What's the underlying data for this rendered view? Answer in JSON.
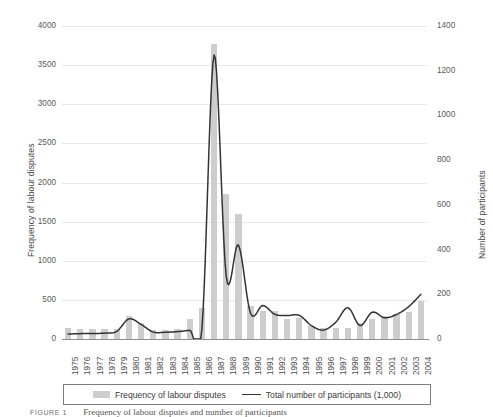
{
  "chart_data": {
    "type": "bar",
    "title": "",
    "subtitle": "",
    "xlabel": "",
    "ylabel": "Frequency of labour disputes",
    "ylabel_secondary": "Number of participants",
    "grid": true,
    "legend_position": "bottom",
    "ylim": [
      0,
      4000
    ],
    "ylim_secondary": [
      0,
      1400
    ],
    "yticks": [
      "0",
      "500",
      "1000",
      "1500",
      "2000",
      "2500",
      "3000",
      "3500",
      "4000"
    ],
    "ytick_values": [
      0,
      500,
      1000,
      1500,
      2000,
      2500,
      3000,
      3500,
      4000
    ],
    "yticks_secondary": [
      "0",
      "200",
      "400",
      "600",
      "800",
      "1000",
      "1200",
      "1400"
    ],
    "ytick_values_secondary": [
      0,
      200,
      400,
      600,
      800,
      1000,
      1200,
      1400
    ],
    "categories": [
      "1975",
      "1976",
      "1977",
      "1978",
      "1979",
      "1980",
      "1981",
      "1982",
      "1983",
      "1984",
      "1985",
      "1986",
      "1987",
      "1988",
      "1989",
      "1990",
      "1991",
      "1992",
      "1993",
      "1994",
      "1995",
      "1996",
      "1997",
      "1998",
      "1999",
      "2000",
      "2001",
      "2002",
      "2003",
      "2004"
    ],
    "series": [
      {
        "name": "Frequency of labour disputes",
        "kind": "bar",
        "axis": "left",
        "color": "#cdcdcd",
        "values": [
          135,
          130,
          125,
          125,
          130,
          290,
          205,
          120,
          115,
          130,
          250,
          400,
          3770,
          1850,
          1600,
          420,
          355,
          355,
          250,
          270,
          170,
          145,
          140,
          140,
          200,
          250,
          290,
          320,
          340,
          480
        ]
      },
      {
        "name": "Total number of participants (1,000)",
        "kind": "line",
        "axis": "right",
        "color": "#333333",
        "values": [
          22,
          24,
          25,
          26,
          34,
          90,
          65,
          31,
          30,
          33,
          39,
          46,
          1270,
          280,
          420,
          115,
          150,
          110,
          105,
          106,
          60,
          40,
          75,
          140,
          60,
          120,
          95,
          110,
          145,
          200
        ]
      }
    ]
  },
  "legend": {
    "entries": [
      {
        "label": "Frequency of labour disputes",
        "marker": "bar-swatch"
      },
      {
        "label": "Total number of participants (1,000)",
        "marker": "line-swatch"
      }
    ]
  },
  "caption": {
    "label": "FIGURE 1",
    "text": "Frequency of labour disputes and number of participants"
  }
}
